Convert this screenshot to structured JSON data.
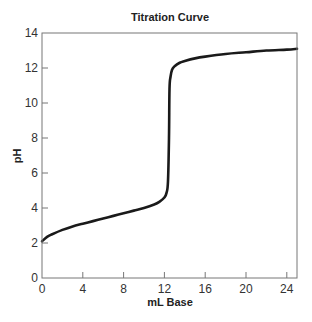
{
  "chart_data": {
    "type": "line",
    "title": "Titration Curve",
    "xlabel": "mL Base",
    "ylabel": "pH",
    "xlim": [
      0,
      25
    ],
    "ylim": [
      0,
      14
    ],
    "xticks": [
      0,
      4,
      8,
      12,
      16,
      20,
      24
    ],
    "yticks": [
      0,
      2,
      4,
      6,
      8,
      10,
      12,
      14
    ],
    "grid": false,
    "legend": null,
    "series": [
      {
        "name": "pH",
        "color": "#1a1a1a",
        "x": [
          0,
          0.5,
          1,
          2,
          3,
          4,
          5,
          6,
          7,
          8,
          9,
          10,
          11,
          11.5,
          12,
          12.2,
          12.35,
          12.45,
          12.5,
          12.6,
          12.75,
          13,
          13.5,
          14,
          15,
          16,
          18,
          20,
          22,
          24,
          25
        ],
        "values": [
          2.1,
          2.35,
          2.5,
          2.75,
          2.95,
          3.1,
          3.25,
          3.4,
          3.55,
          3.7,
          3.85,
          4.0,
          4.2,
          4.35,
          4.6,
          4.85,
          5.5,
          8.0,
          10.8,
          11.5,
          11.9,
          12.1,
          12.3,
          12.4,
          12.55,
          12.65,
          12.8,
          12.9,
          13.0,
          13.05,
          13.1
        ]
      }
    ]
  }
}
